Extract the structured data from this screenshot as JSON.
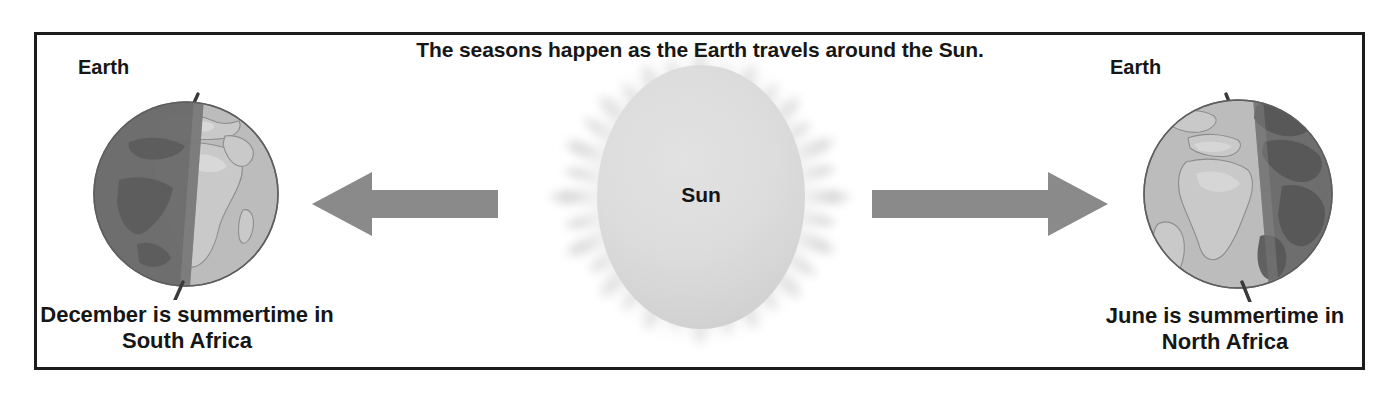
{
  "diagram": {
    "title": "The seasons happen as the Earth travels around the Sun.",
    "sun": {
      "label": "Sun",
      "body_color": "#d8d8d8",
      "corona_color": "#e6e6e6"
    },
    "arrows": {
      "left": {
        "name": "orbit-arrow-left",
        "direction": "left",
        "color": "#8a8a8a"
      },
      "right": {
        "name": "orbit-arrow-right",
        "direction": "right",
        "color": "#8a8a8a"
      }
    },
    "earths": [
      {
        "side": "left",
        "label": "Earth",
        "caption_line1": "December is summertime in",
        "caption_line2": "South Africa",
        "lit_side": "right",
        "shadow_side": "left",
        "lit_color": "#b8b8b8",
        "shadow_color": "#6b6b6b",
        "axis_tilt_deg": 12
      },
      {
        "side": "right",
        "label": "Earth",
        "caption_line1": "June is summertime in",
        "caption_line2": "North Africa",
        "lit_side": "left",
        "shadow_side": "right",
        "lit_color": "#b8b8b8",
        "shadow_color": "#6b6b6b",
        "axis_tilt_deg": 12
      }
    ],
    "frame": {
      "border_color": "#1c1c1c",
      "background_color": "#ffffff"
    }
  }
}
